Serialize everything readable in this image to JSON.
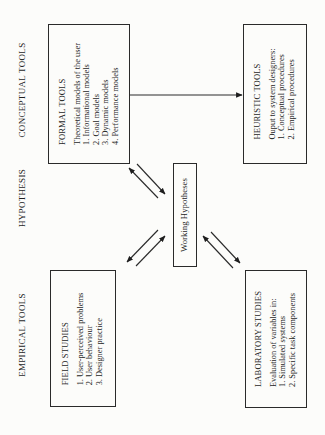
{
  "row_labels": {
    "conceptual": "CONCEPTUAL TOOLS",
    "hypothesis": "HYPOTHESIS",
    "empirical": "EMPIRICAL TOOLS"
  },
  "boxes": {
    "formal_tools": {
      "title": "FORMAL TOOLS",
      "lines": [
        "Theoretical models of the user",
        "1. Informational models",
        "2. Goal models",
        "3. Dynamic models",
        "4. Performance models"
      ]
    },
    "heuristic_tools": {
      "title": "HEURISTIC TOOLS",
      "lines": [
        "Ouput to system designers:",
        "1. Conceptual procedures",
        "2. Empirical procedures"
      ]
    },
    "working_hypotheses": {
      "title": "Working Hypotheses"
    },
    "field_studies": {
      "title": "FIELD STUDIES",
      "lines": [
        "1. User-perceived problems",
        "2. User behaviour",
        "3. Designer practice"
      ]
    },
    "laboratory_studies": {
      "title": "LABORATORY STUDIES",
      "lines": [
        "Evaluation of variables in:",
        "1. Simulated systems",
        "2. Specific task components"
      ]
    }
  },
  "connections": [
    {
      "from": "formal_tools",
      "to": "heuristic_tools",
      "type": "one-way"
    },
    {
      "from": "formal_tools",
      "to": "working_hypotheses",
      "type": "two-way-pair"
    },
    {
      "from": "field_studies",
      "to": "working_hypotheses",
      "type": "two-way-pair"
    },
    {
      "from": "laboratory_studies",
      "to": "working_hypotheses",
      "type": "two-way-pair"
    }
  ],
  "colors": {
    "line": "#2a2a2a",
    "background": "#fcfcfa"
  }
}
